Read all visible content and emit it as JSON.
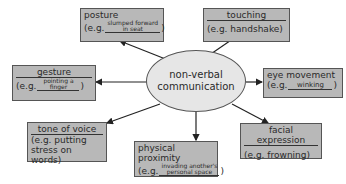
{
  "center": {
    "line1": "non-verbal",
    "line2": "communication"
  },
  "eg_prefix": "(e.g.",
  "close_paren": ")",
  "nodes": {
    "posture": {
      "title": "posture",
      "fill1": "slumped forward",
      "fill2": "in seat"
    },
    "touching": {
      "title": "touching",
      "example": "(e.g. handshake)"
    },
    "gesture": {
      "title": "gesture",
      "fill1": "pointing a",
      "fill2": "finger"
    },
    "eye_movement": {
      "title": "eye movement",
      "fill1": "winking"
    },
    "tone_of_voice": {
      "title": "tone of voice",
      "example1": "(e.g. putting",
      "example2": "stress on words)"
    },
    "physical_proximity": {
      "title": "physical proximity",
      "fill1": "invading another's",
      "fill2": "personal space"
    },
    "facial_expression": {
      "title": "facial expression",
      "example": "(e.g. frowning)"
    }
  },
  "colors": {
    "box_fill": "#b8b8b8",
    "ellipse_fill": "#e6e6e6",
    "line": "#222222"
  }
}
